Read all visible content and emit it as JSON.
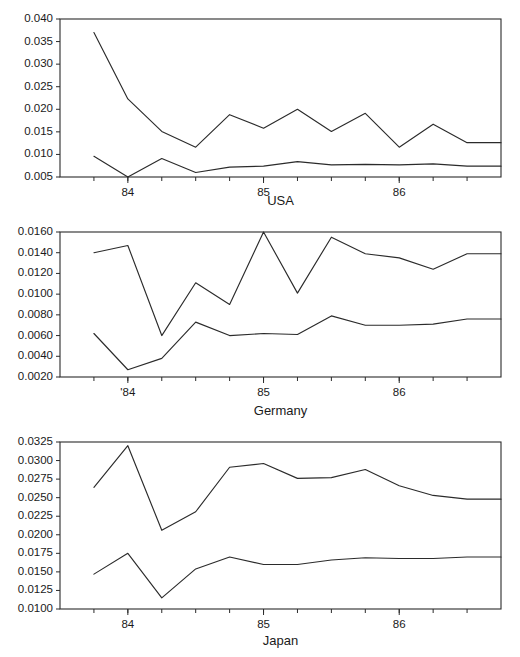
{
  "figure": {
    "panel_order": [
      "usa",
      "germany",
      "japan"
    ]
  },
  "chart_data": [
    {
      "type": "line",
      "title": "USA",
      "xlabel": "",
      "ylabel": "",
      "grid": false,
      "legend": "none",
      "ylim": [
        0.005,
        0.04
      ],
      "ytick_labels": [
        "0.040",
        "0.035",
        "0.030",
        "0.025",
        "0.020",
        "0.015",
        "0.010",
        "0.005"
      ],
      "ytick_values": [
        0.04,
        0.035,
        0.03,
        0.025,
        0.02,
        0.015,
        0.01,
        0.005
      ],
      "xlim": [
        0,
        13
      ],
      "xtick_labels": [
        "84",
        "85",
        "86"
      ],
      "xtick_values": [
        2,
        6,
        10
      ],
      "x": [
        1,
        2,
        3,
        4,
        5,
        6,
        7,
        8,
        9,
        10,
        11,
        12,
        13
      ],
      "series": [
        {
          "name": "upper",
          "values": [
            0.037,
            0.0223,
            0.0151,
            0.0116,
            0.0188,
            0.0158,
            0.02,
            0.0151,
            0.0191,
            0.0116,
            0.0167,
            0.0126,
            0.0126
          ]
        },
        {
          "name": "lower",
          "values": [
            0.0096,
            0.005,
            0.0091,
            0.006,
            0.0072,
            0.0074,
            0.0084,
            0.0077,
            0.0078,
            0.0077,
            0.0079,
            0.0074,
            0.0074
          ]
        }
      ]
    },
    {
      "type": "line",
      "title": "Germany",
      "xlabel": "",
      "ylabel": "",
      "grid": false,
      "legend": "none",
      "ylim": [
        0.002,
        0.016
      ],
      "ytick_labels": [
        "0.0160",
        "0.0140",
        "0.0120",
        "0.0100",
        "0.0080",
        "0.0060",
        "0.0040",
        "0.0020"
      ],
      "ytick_values": [
        0.016,
        0.014,
        0.012,
        0.01,
        0.008,
        0.006,
        0.004,
        0.002
      ],
      "xlim": [
        0,
        13
      ],
      "xtick_labels": [
        "'84",
        "85",
        "86"
      ],
      "xtick_values": [
        2,
        6,
        10
      ],
      "x": [
        1,
        2,
        3,
        4,
        5,
        6,
        7,
        8,
        9,
        10,
        11,
        12,
        13
      ],
      "series": [
        {
          "name": "upper",
          "values": [
            0.014,
            0.0147,
            0.006,
            0.0111,
            0.009,
            0.016,
            0.0101,
            0.0155,
            0.0139,
            0.0135,
            0.0124,
            0.0139,
            0.0139
          ]
        },
        {
          "name": "lower",
          "values": [
            0.0062,
            0.0027,
            0.0038,
            0.0073,
            0.006,
            0.0062,
            0.0061,
            0.0079,
            0.007,
            0.007,
            0.0071,
            0.0076,
            0.0076
          ]
        }
      ]
    },
    {
      "type": "line",
      "title": "Japan",
      "xlabel": "",
      "ylabel": "",
      "grid": false,
      "legend": "none",
      "ylim": [
        0.01,
        0.0325
      ],
      "ytick_labels": [
        "0.0325",
        "0.0300",
        "0.0275",
        "0.0250",
        "0.0225",
        "0.0200",
        "0.0175",
        "0.0150",
        "0.0125",
        "0.0100"
      ],
      "ytick_values": [
        0.0325,
        0.03,
        0.0275,
        0.025,
        0.0225,
        0.02,
        0.0175,
        0.015,
        0.0125,
        0.01
      ],
      "xlim": [
        0,
        13
      ],
      "xtick_labels": [
        "84",
        "85",
        "86"
      ],
      "xtick_values": [
        2,
        6,
        10
      ],
      "x": [
        1,
        2,
        3,
        4,
        5,
        6,
        7,
        8,
        9,
        10,
        11,
        12,
        13
      ],
      "series": [
        {
          "name": "upper",
          "values": [
            0.0264,
            0.032,
            0.0206,
            0.0231,
            0.0291,
            0.0296,
            0.0276,
            0.0277,
            0.0288,
            0.0266,
            0.0253,
            0.0248,
            0.0248
          ]
        },
        {
          "name": "lower",
          "values": [
            0.0147,
            0.0175,
            0.0115,
            0.0154,
            0.017,
            0.016,
            0.016,
            0.0166,
            0.0169,
            0.0168,
            0.0168,
            0.017,
            0.017
          ]
        }
      ]
    }
  ]
}
